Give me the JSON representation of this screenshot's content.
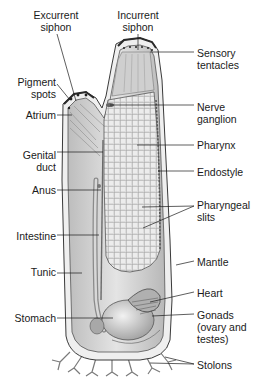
{
  "figure": {
    "footer_fragment": "27.0"
  },
  "labels": [
    {
      "id": "excurrent-siphon",
      "text": "Excurrent\nsiphon",
      "x": 30,
      "y": 9,
      "align": "center",
      "w": 52,
      "line": [
        [
          57,
          34
        ],
        [
          76,
          101
        ]
      ]
    },
    {
      "id": "incurrent-siphon",
      "text": "Incurrent\nsiphon",
      "x": 110,
      "y": 9,
      "align": "center",
      "w": 56,
      "line": [
        [
          138,
          34
        ],
        [
          138,
          50
        ]
      ]
    },
    {
      "id": "sensory-tentacles",
      "text": "Sensory\ntentacles",
      "x": 197,
      "y": 47,
      "align": "left",
      "w": 60,
      "line": [
        [
          150,
          52
        ],
        [
          194,
          52
        ]
      ]
    },
    {
      "id": "pigment-spots",
      "text": "Pigment\nspots",
      "x": 16,
      "y": 76,
      "align": "right",
      "w": 40,
      "line": [
        [
          57,
          84
        ],
        [
          70,
          100
        ]
      ]
    },
    {
      "id": "atrium",
      "text": "Atrium",
      "x": 22,
      "y": 109,
      "align": "right",
      "w": 34,
      "line": [
        [
          57,
          115
        ],
        [
          72,
          115
        ]
      ]
    },
    {
      "id": "nerve-ganglion",
      "text": "Nerve\nganglion",
      "x": 197,
      "y": 101,
      "align": "left",
      "w": 60,
      "line": [
        [
          110,
          105
        ],
        [
          194,
          105
        ]
      ]
    },
    {
      "id": "genital-duct",
      "text": "Genital\nduct",
      "x": 18,
      "y": 149,
      "align": "right",
      "w": 38,
      "line": [
        [
          57,
          152
        ],
        [
          103,
          152
        ]
      ]
    },
    {
      "id": "pharynx",
      "text": "Pharynx",
      "x": 197,
      "y": 139,
      "align": "left",
      "w": 60,
      "line": [
        [
          137,
          145
        ],
        [
          194,
          145
        ]
      ]
    },
    {
      "id": "endostyle",
      "text": "Endostyle",
      "x": 197,
      "y": 166,
      "align": "left",
      "w": 60,
      "line": [
        [
          158,
          171
        ],
        [
          194,
          171
        ]
      ]
    },
    {
      "id": "anus",
      "text": "Anus",
      "x": 26,
      "y": 184,
      "align": "right",
      "w": 30,
      "line": [
        [
          57,
          190
        ],
        [
          101,
          190
        ]
      ]
    },
    {
      "id": "pharyngeal-slits",
      "text": "Pharyngeal\nslits",
      "x": 197,
      "y": 199,
      "align": "left",
      "w": 60,
      "line": [
        [
          194,
          206
        ],
        [
          142,
          207
        ]
      ],
      "line2": [
        [
          194,
          206
        ],
        [
          143,
          228
        ]
      ]
    },
    {
      "id": "intestine",
      "text": "Intestine",
      "x": 6,
      "y": 230,
      "align": "right",
      "w": 50,
      "line": [
        [
          57,
          235
        ],
        [
          99,
          235
        ]
      ]
    },
    {
      "id": "mantle",
      "text": "Mantle",
      "x": 197,
      "y": 256,
      "align": "left",
      "w": 60,
      "line": [
        [
          194,
          261
        ],
        [
          176,
          265
        ]
      ]
    },
    {
      "id": "tunic",
      "text": "Tunic",
      "x": 22,
      "y": 266,
      "align": "right",
      "w": 34,
      "line": [
        [
          57,
          273
        ],
        [
          82,
          273
        ]
      ]
    },
    {
      "id": "heart",
      "text": "Heart",
      "x": 197,
      "y": 287,
      "align": "left",
      "w": 60,
      "line": [
        [
          194,
          292
        ],
        [
          150,
          302
        ]
      ]
    },
    {
      "id": "stomach",
      "text": "Stomach",
      "x": 6,
      "y": 312,
      "align": "right",
      "w": 50,
      "line": [
        [
          57,
          318
        ],
        [
          113,
          318
        ]
      ]
    },
    {
      "id": "gonads",
      "text": "Gonads\n(ovary and\ntestes)",
      "x": 197,
      "y": 309,
      "align": "left",
      "w": 62,
      "line": [
        [
          194,
          314
        ],
        [
          152,
          316
        ]
      ]
    },
    {
      "id": "stolons",
      "text": "Stolons",
      "x": 197,
      "y": 359,
      "align": "left",
      "w": 60,
      "line": [
        [
          194,
          364
        ],
        [
          165,
          357
        ]
      ],
      "line2": [
        [
          194,
          364
        ],
        [
          150,
          363
        ]
      ]
    }
  ],
  "colors": {
    "outline": "#3a3a3a",
    "tunic_fill": "#ececec",
    "mantle_fill": "#cfcfcf",
    "pharynx_fill": "#d8d8d8",
    "grid": "#8a8a8a",
    "gut_fill": "#bdbdbd",
    "leader": "#1a1a1a",
    "text": "#1a1a1a"
  }
}
